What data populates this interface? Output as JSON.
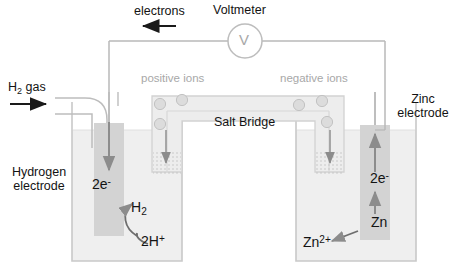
{
  "diagram": {
    "canvas": {
      "width": 449,
      "height": 278,
      "background": "#ffffff"
    }
  },
  "colors": {
    "text_dark": "#131313",
    "text_grey": "#a8a8a8",
    "glass": "#c9c9c9",
    "wire": "#b0b0b0",
    "electrode_fill": "#d3d3d3",
    "solution_fill": "#efefef",
    "salt_bridge_fill": "#ededed",
    "arrow_dark": "#555555",
    "ion_fill": "#dcdcdc"
  },
  "labels": {
    "electrons": "electrons",
    "voltmeter": "Voltmeter",
    "voltmeter_symbol": "V",
    "h2_gas": {
      "formula": "H",
      "sub": "2",
      "tail": " gas"
    },
    "positive_ions": "positive ions",
    "negative_ions": "negative ions",
    "salt_bridge": "Salt Bridge",
    "hydrogen_electrode_line1": "Hydrogen",
    "hydrogen_electrode_line2": "electrode",
    "zinc_electrode_line1": "Zinc",
    "zinc_electrode_line2": "electrode",
    "left_electrons": {
      "main": "2e",
      "sup": "-"
    },
    "right_electrons": {
      "main": "2e",
      "sup": "-"
    },
    "hydrogen_gas_product": {
      "main": "H",
      "sub": "2"
    },
    "protons": {
      "main": "2H",
      "sup": "+"
    },
    "zinc_metal": "Zn",
    "zinc_ion": {
      "main": "Zn",
      "sup": "2+"
    }
  },
  "ions": {
    "positive": [
      {
        "x": 160,
        "y": 104,
        "symbol": "+"
      },
      {
        "x": 182,
        "y": 100,
        "symbol": "+"
      },
      {
        "x": 160,
        "y": 124,
        "symbol": "+"
      }
    ],
    "negative": [
      {
        "x": 299,
        "y": 105,
        "symbol": "–"
      },
      {
        "x": 322,
        "y": 101,
        "symbol": "–"
      },
      {
        "x": 327,
        "y": 122,
        "symbol": "–"
      }
    ]
  },
  "flows": [
    {
      "name": "electrons-external-circuit",
      "direction": "right-to-left",
      "label": "electrons"
    },
    {
      "name": "electrons-into-hydrogen-electrode",
      "direction": "down",
      "label": "2e-"
    },
    {
      "name": "electrons-up-zinc-electrode",
      "direction": "up",
      "label": "2e-"
    },
    {
      "name": "positive-ions-into-left-beaker",
      "direction": "down"
    },
    {
      "name": "negative-ions-into-right-beaker",
      "direction": "down"
    },
    {
      "name": "h2-gas-inlet",
      "direction": "right"
    },
    {
      "name": "proton-reduction",
      "reaction": "2H+ + 2e- -> H2"
    },
    {
      "name": "zinc-oxidation",
      "reaction": "Zn -> Zn2+ + 2e-"
    }
  ]
}
